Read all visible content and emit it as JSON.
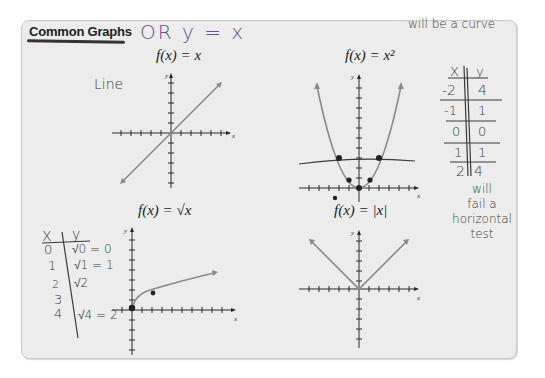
{
  "panel": {
    "heading": "Common Graphs",
    "annotation_heading": "OR y = x"
  },
  "graphs": [
    {
      "id": "identity",
      "title_prefix": "f(x) = ",
      "title_expr": "x",
      "note": "Line",
      "axis_labels": {
        "x": "x",
        "y": "y"
      }
    },
    {
      "id": "square",
      "title_prefix": "f(x) = ",
      "title_expr": "x²",
      "note": "will be a curve",
      "axis_labels": {
        "x": "x",
        "y": "y"
      }
    },
    {
      "id": "sqrt",
      "title_prefix": "f(x) = ",
      "title_expr": "√x",
      "axis_labels": {
        "x": "x",
        "y": "y"
      }
    },
    {
      "id": "abs",
      "title_prefix": "f(x) = ",
      "title_expr": "|x|",
      "axis_labels": {
        "x": "x",
        "y": "y"
      }
    }
  ],
  "square_table": {
    "headers": [
      "X",
      "y"
    ],
    "rows": [
      [
        "-2",
        "4"
      ],
      [
        "-1",
        "1"
      ],
      [
        "0",
        "0"
      ],
      [
        "1",
        "1"
      ],
      [
        "2",
        "4"
      ]
    ],
    "note_lines": [
      "will",
      "fail a",
      "horizontal",
      "test"
    ]
  },
  "sqrt_table": {
    "headers": [
      "X",
      "y"
    ],
    "rows": [
      [
        "0",
        "√0 = 0"
      ],
      [
        "1",
        "√1 = 1"
      ],
      [
        "2",
        "√2"
      ],
      [
        "3",
        ""
      ],
      [
        "4",
        "√4 = 2"
      ]
    ]
  }
}
